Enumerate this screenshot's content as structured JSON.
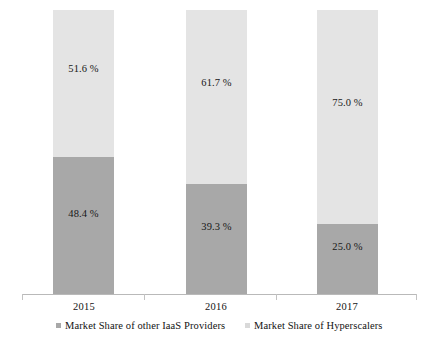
{
  "chart_data": {
    "type": "bar",
    "title": "",
    "subtitle": "",
    "xlabel": "",
    "ylabel": "",
    "stacked": true,
    "stack_mode": "percent",
    "ylim": [
      0,
      100
    ],
    "grid": false,
    "legend_position": "bottom",
    "categories": [
      "2015",
      "2016",
      "2017"
    ],
    "series": [
      {
        "name": "Market Share of other IaaS Providers",
        "color": "#a8a8a8",
        "values": [
          48.4,
          39.3,
          25.0
        ],
        "labels": [
          "48.4 %",
          "39.3 %",
          "25.0 %"
        ]
      },
      {
        "name": "Market Share of Hyperscalers",
        "color": "#e4e4e4",
        "values": [
          51.6,
          61.7,
          75.0
        ],
        "labels": [
          "51.6 %",
          "61.7 %",
          "75.0 %"
        ]
      }
    ]
  },
  "axis": {
    "tick_count": 4,
    "line_color": "#b9b9b9"
  },
  "legend": {
    "items": [
      {
        "label": "Market Share of other IaaS Providers",
        "marker": "square-marker"
      },
      {
        "label": "Market Share of Hyperscalers",
        "marker": "square-marker"
      }
    ]
  }
}
